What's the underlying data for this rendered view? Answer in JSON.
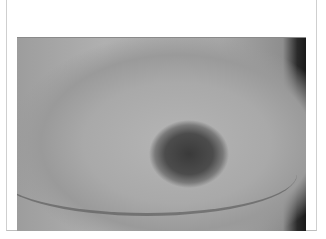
{
  "image": {
    "kind": "clinical photograph",
    "colorMode": "grayscale",
    "description": "Close-up clinical photograph of a skin lesion within a white bordered frame",
    "frameColor": "#ffffff",
    "borderColor": "#cfcfcf"
  }
}
